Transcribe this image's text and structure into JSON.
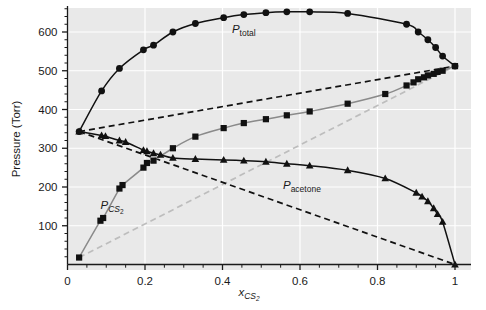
{
  "figure": {
    "background_color": "#ffffff",
    "plot_background_color": "#e9e9e9",
    "gridline_color": "#ffffff",
    "axis_color": "#1a1a1a",
    "marker_color": "#111111",
    "raoult_line_color": "#bdbdbd"
  },
  "chart_data": {
    "type": "scatter",
    "title": "",
    "xlabel": "x_CS2",
    "xlabel_parts": {
      "symbol": "x",
      "subscript": "CS",
      "subscript_number": "2"
    },
    "ylabel": "Pressure (Torr)",
    "xlim": [
      0,
      1
    ],
    "ylim": [
      0,
      680
    ],
    "xticks": [
      0,
      0.2,
      0.4,
      0.6,
      0.8,
      1
    ],
    "xtick_labels": [
      "0",
      "0.2",
      "0.4",
      "0.6",
      "0.8",
      "1"
    ],
    "xminor_step": 0.05,
    "yticks": [
      100,
      200,
      300,
      400,
      500,
      600
    ],
    "ytick_labels": [
      "100",
      "200",
      "300",
      "400",
      "500",
      "600"
    ],
    "yminor_step": 20,
    "grid": true,
    "grid_color": "#ffffff",
    "legend_position": "inline-annotations",
    "annotations": [
      {
        "name": "P_total",
        "symbol": "P",
        "subscript": "total",
        "italic_subscript": false,
        "x": 0.455,
        "y": 598
      },
      {
        "name": "P_CS2",
        "symbol": "P",
        "subscript": "CS",
        "subscript_number": "2",
        "italic_subscript": true,
        "x": 0.115,
        "y": 143
      },
      {
        "name": "P_acetone",
        "symbol": "P",
        "subscript": "acetone",
        "italic_subscript": false,
        "x": 0.605,
        "y": 196
      }
    ],
    "series": [
      {
        "name": "P_total",
        "label": "P total",
        "marker": "circle",
        "line_style": "solid",
        "line_color": "#111111",
        "x": [
          0.03,
          0.088,
          0.134,
          0.196,
          0.222,
          0.272,
          0.33,
          0.403,
          0.455,
          0.512,
          0.566,
          0.625,
          0.723,
          0.875,
          0.905,
          0.93,
          0.95,
          0.968,
          1.0
        ],
        "y": [
          343,
          448,
          506,
          554,
          566,
          600,
          622,
          637,
          645,
          650,
          652,
          652,
          648,
          620,
          600,
          580,
          560,
          538,
          512
        ]
      },
      {
        "name": "P_CS2",
        "label": "P CS2",
        "marker": "square",
        "line_style": "solid",
        "line_color": "#8a8a8a",
        "x": [
          0.03,
          0.085,
          0.092,
          0.134,
          0.142,
          0.196,
          0.205,
          0.222,
          0.272,
          0.33,
          0.403,
          0.455,
          0.512,
          0.566,
          0.625,
          0.723,
          0.82,
          0.875,
          0.893,
          0.905,
          0.92,
          0.93,
          0.945,
          0.955,
          0.968,
          1.0
        ],
        "y": [
          18,
          113,
          120,
          196,
          205,
          250,
          262,
          268,
          300,
          330,
          352,
          365,
          375,
          385,
          395,
          415,
          440,
          462,
          470,
          478,
          483,
          488,
          492,
          497,
          500,
          512
        ]
      },
      {
        "name": "P_acetone",
        "label": "P acetone",
        "marker": "triangle",
        "line_style": "solid",
        "line_color": "#111111",
        "x": [
          0.03,
          0.088,
          0.098,
          0.134,
          0.15,
          0.196,
          0.205,
          0.222,
          0.24,
          0.272,
          0.33,
          0.403,
          0.455,
          0.512,
          0.566,
          0.625,
          0.723,
          0.82,
          0.9,
          0.915,
          0.93,
          0.945,
          0.955,
          0.968,
          1.0
        ],
        "y": [
          343,
          333,
          331,
          320,
          316,
          295,
          292,
          287,
          283,
          275,
          272,
          270,
          268,
          265,
          260,
          255,
          243,
          222,
          185,
          175,
          163,
          145,
          130,
          110,
          0
        ]
      }
    ],
    "raoult_lines": [
      {
        "name": "raoult-total-ideal",
        "style": "dashed",
        "color": "#111111",
        "x": [
          0.03,
          1.0
        ],
        "y": [
          343,
          512
        ]
      },
      {
        "name": "raoult-cs2-ideal",
        "style": "dashed",
        "color": "#bdbdbd",
        "x": [
          0.03,
          1.0
        ],
        "y": [
          18,
          512
        ]
      },
      {
        "name": "raoult-acetone-ideal",
        "style": "dashed",
        "color": "#111111",
        "x": [
          0.03,
          1.0
        ],
        "y": [
          343,
          0
        ]
      }
    ]
  }
}
